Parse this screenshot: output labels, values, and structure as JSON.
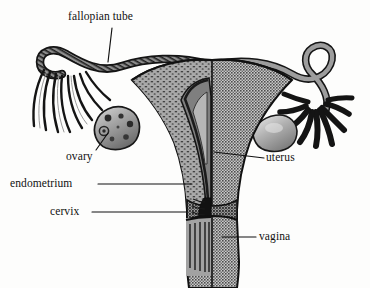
{
  "figure": {
    "style": "black-and-white halftone medical illustration",
    "background_color": "#fdfdfc",
    "ink_color": "#111111"
  },
  "labels": [
    {
      "id": "fallopian-tube",
      "text": "fallopian tube",
      "side": "top"
    },
    {
      "id": "ovary",
      "text": "ovary",
      "side": "left"
    },
    {
      "id": "endometrium",
      "text": "endometrium",
      "side": "left"
    },
    {
      "id": "cervix",
      "text": "cervix",
      "side": "left"
    },
    {
      "id": "uterus",
      "text": "uterus",
      "side": "right"
    },
    {
      "id": "vagina",
      "text": "vagina",
      "side": "right"
    }
  ],
  "structures": {
    "fallopian_tube_left": "cut-away fallopian tube with fimbriae",
    "fallopian_tube_right": "intact fallopian tube with dark fimbriae",
    "ovary_left": "sectioned ovary showing follicles",
    "ovary_right": "intact ovary, smooth shaded",
    "uterus_left_half": "myometrium shown in cross-section with stipple texture",
    "uterus_right_half": "outer uterine surface, halftone gray",
    "endometrium": "inner uterine lining",
    "cervix": "narrowed neck of uterus with cervical canal",
    "vagina": "canal below cervix with rugae"
  },
  "colors": {
    "outline": "#101010",
    "halftone_gray": "#8a8a8a",
    "mid_gray": "#9a9a9a",
    "light_gray": "#b8b8b8",
    "dark_gray": "#4a4a4a",
    "near_black": "#1c1c1c",
    "paper": "#fdfdfc"
  }
}
